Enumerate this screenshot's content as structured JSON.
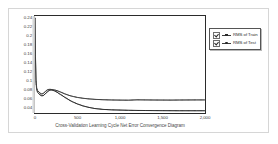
{
  "chart_data": {
    "type": "line",
    "title": "",
    "xlabel": "Cross-Validation Learning Cycle Net Error Convergence Diagram",
    "ylabel": "",
    "xlim": [
      0,
      2000
    ],
    "ylim": [
      0.03,
      0.245
    ],
    "grid": false,
    "legend_position": "right",
    "xticks": [
      0,
      500,
      1000,
      1500,
      2000
    ],
    "xtick_labels": [
      "0",
      "500",
      "1,000",
      "1,500",
      "2,000"
    ],
    "yticks": [
      0.04,
      0.06,
      0.08,
      0.1,
      0.12,
      0.14,
      0.16,
      0.18,
      0.2,
      0.22,
      0.24
    ],
    "ytick_labels": [
      "0.04",
      "0.06",
      "0.08",
      "0.1",
      "0.12",
      "0.14",
      "0.16",
      "0.18",
      "0.2",
      "0.22",
      "0.24"
    ],
    "series": [
      {
        "name": "RMS of Train",
        "color": "#2a2a2a",
        "x": [
          0,
          5,
          12,
          20,
          30,
          45,
          60,
          80,
          100,
          125,
          150,
          175,
          200,
          230,
          260,
          300,
          350,
          400,
          450,
          500,
          560,
          620,
          700,
          800,
          900,
          1000,
          1100,
          1200,
          1300,
          1400,
          1500,
          1600,
          1700,
          1800,
          1900,
          2000
        ],
        "y": [
          0.24,
          0.155,
          0.098,
          0.081,
          0.076,
          0.073,
          0.07,
          0.068,
          0.069,
          0.073,
          0.078,
          0.081,
          0.081,
          0.079,
          0.076,
          0.071,
          0.065,
          0.059,
          0.054,
          0.05,
          0.046,
          0.043,
          0.04,
          0.038,
          0.037,
          0.0365,
          0.036,
          0.0357,
          0.0355,
          0.0353,
          0.0352,
          0.0351,
          0.035,
          0.035,
          0.035,
          0.035
        ]
      },
      {
        "name": "RMS of Test",
        "color": "#3c3c3c",
        "x": [
          0,
          5,
          12,
          20,
          30,
          45,
          60,
          80,
          100,
          125,
          150,
          175,
          200,
          230,
          260,
          300,
          350,
          400,
          450,
          500,
          560,
          620,
          700,
          800,
          900,
          1000,
          1100,
          1200,
          1300,
          1400,
          1500,
          1600,
          1700,
          1800,
          1900,
          2000
        ],
        "y": [
          0.24,
          0.16,
          0.103,
          0.086,
          0.08,
          0.077,
          0.074,
          0.072,
          0.074,
          0.078,
          0.082,
          0.0825,
          0.082,
          0.081,
          0.0795,
          0.0765,
          0.0725,
          0.069,
          0.0665,
          0.0645,
          0.0628,
          0.0615,
          0.0603,
          0.0594,
          0.0589,
          0.0586,
          0.0584,
          0.0592,
          0.059,
          0.0588,
          0.0587,
          0.0586,
          0.0588,
          0.0589,
          0.059,
          0.059
        ]
      }
    ]
  },
  "legend": {
    "items": [
      {
        "label": "RMS of Train",
        "checked": true
      },
      {
        "label": "RMS of Test",
        "checked": true
      }
    ]
  }
}
